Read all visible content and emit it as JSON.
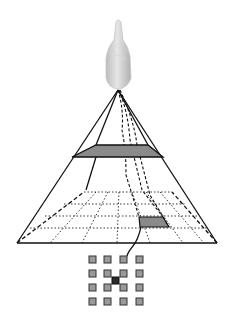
{
  "diagram": {
    "elements": {
      "camera": "camera-object",
      "pyramid": "view-frustum",
      "slab": "image-plane",
      "ground_grid": "ground-grid",
      "highlighted_cell": "ground-cell",
      "pixel_grid": {
        "rows": 4,
        "cols": 4,
        "highlighted": [
          1,
          1.5
        ]
      }
    },
    "colors": {
      "line": "#111111",
      "slab_fill": "#8a8a8a",
      "cell_fill": "#8a8a8a",
      "pixel_fill": "#9a9a9a",
      "pixel_border": "#333333",
      "pixel_center": "#2a2a2a",
      "camera_body": "#cfcfcf"
    }
  }
}
